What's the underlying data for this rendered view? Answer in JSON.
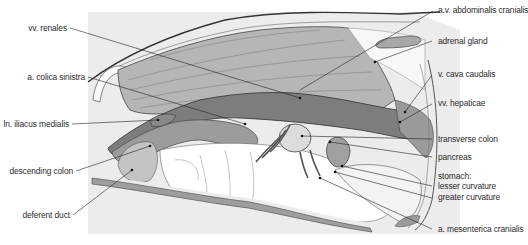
{
  "figure": {
    "type": "anatomical-illustration",
    "colors": {
      "background_panel": "#ececec",
      "muscle_fill": "#b4b4b4",
      "vessel_dark": "#7a7a7a",
      "organ_mid": "#9a9a9a",
      "line": "#333333",
      "label_text": "#2b2b2b"
    }
  },
  "labels_left": [
    {
      "id": "vv-renales",
      "text": "vv. renales"
    },
    {
      "id": "a-colica-sinistra",
      "text": "a. colica sinistra"
    },
    {
      "id": "ln-iliacus-medialis",
      "text": "ln. iliacus medialis"
    },
    {
      "id": "descending-colon",
      "text": "descending colon"
    },
    {
      "id": "deferent-duct",
      "text": "deferent duct"
    }
  ],
  "labels_right": [
    {
      "id": "av-abdominalis-cranialis",
      "text": "a.v. abdominalis cranialis"
    },
    {
      "id": "adrenal-gland",
      "text": "adrenal gland"
    },
    {
      "id": "v-cava-caudalis",
      "text": "v. cava caudalis"
    },
    {
      "id": "vv-hepaticae",
      "text": "vv. hepaticae"
    },
    {
      "id": "transverse-colon",
      "text": "transverse colon"
    },
    {
      "id": "pancreas",
      "text": "pancreas"
    },
    {
      "id": "stomach",
      "text": "stomach:"
    },
    {
      "id": "lesser-curvature",
      "text": "lesser curvature"
    },
    {
      "id": "greater-curvature",
      "text": "greater curvature"
    },
    {
      "id": "a-mesenterica-cranialis",
      "text": "a. mesenterica cranialis"
    }
  ]
}
